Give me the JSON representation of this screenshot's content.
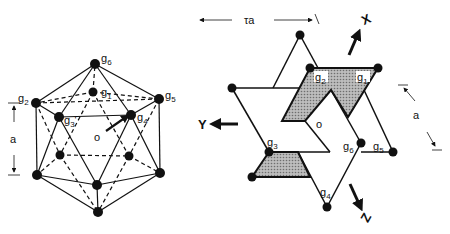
{
  "left_figure": {
    "name": "icosahedron",
    "vertex_labels": {
      "g1": "g1",
      "g2": "g2",
      "g3": "g3'",
      "g4": "g4",
      "g5": "g5",
      "g6": "g6"
    },
    "center_label": "o",
    "dimension_label": "a"
  },
  "right_figure": {
    "name": "projection",
    "vertex_labels": {
      "g1": "g1",
      "g2": "g2",
      "g3": "g3",
      "g4": "g4",
      "g5": "g5",
      "g6": "g6"
    },
    "center_label": "o",
    "width_label": "τa",
    "side_label": "a",
    "axes": {
      "x": "X",
      "y": "Y",
      "z": "Z"
    }
  },
  "colors": {
    "ink": "#111111",
    "shade": "#9a9a9a",
    "background": "#ffffff"
  }
}
